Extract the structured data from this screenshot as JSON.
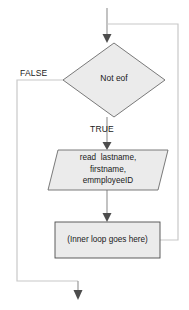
{
  "diagram": {
    "background_color": "#ffffff",
    "shape_fill": "#ebebeb",
    "shape_stroke": "#5a5a5a",
    "connector_color": "#9a9a9a",
    "text_color": "#1a1a1a",
    "nodes": [
      {
        "id": "decision",
        "type": "decision",
        "shape": "diamond",
        "label": "Not eof"
      },
      {
        "id": "input",
        "type": "input-output",
        "shape": "parallelogram",
        "label": "read  lastname,\nfirstname,\nemmployeeID",
        "lines": [
          "read  lastname,",
          "firstname,",
          "emmployeeID"
        ]
      },
      {
        "id": "process",
        "type": "process",
        "shape": "rectangle",
        "label": "(Inner loop goes here)"
      }
    ],
    "edge_labels": {
      "false": "FALSE",
      "true": "TRUE"
    },
    "connectors": [
      {
        "id": "entry-arrow",
        "from": "top",
        "to": "decision"
      },
      {
        "id": "false-branch",
        "from": "decision",
        "to": "exit"
      },
      {
        "id": "true-branch",
        "from": "decision",
        "to": "input"
      },
      {
        "id": "input-to-process",
        "from": "input",
        "to": "process"
      },
      {
        "id": "loop-back",
        "from": "process",
        "to": "decision"
      },
      {
        "id": "exit-arrow",
        "from": "false-branch",
        "to": "bottom"
      }
    ]
  }
}
